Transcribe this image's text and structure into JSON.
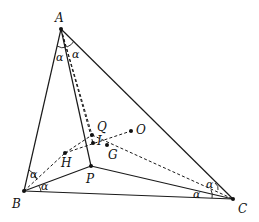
{
  "figure": {
    "type": "geometry-diagram",
    "points": {
      "A": {
        "label": "A",
        "x": 61,
        "y": 29
      },
      "B": {
        "label": "B",
        "x": 24,
        "y": 191
      },
      "C": {
        "label": "C",
        "x": 233,
        "y": 199
      },
      "P": {
        "label": "P",
        "x": 91,
        "y": 166
      },
      "Q": {
        "label": "Q",
        "x": 92,
        "y": 135
      },
      "I": {
        "label": "I",
        "x": 93,
        "y": 143
      },
      "G": {
        "label": "G",
        "x": 107,
        "y": 145
      },
      "O": {
        "label": "O",
        "x": 131,
        "y": 131
      },
      "H": {
        "label": "H",
        "x": 65,
        "y": 153
      }
    },
    "solid_segments": [
      [
        "A",
        "B"
      ],
      [
        "B",
        "C"
      ],
      [
        "C",
        "A"
      ],
      [
        "A",
        "P"
      ],
      [
        "B",
        "P"
      ],
      [
        "C",
        "P"
      ]
    ],
    "dashed_segments": [
      [
        "A",
        "I"
      ],
      [
        "A",
        "Q"
      ],
      [
        "H",
        "Q"
      ],
      [
        "H",
        "O"
      ],
      [
        "Q",
        "C"
      ]
    ],
    "angle_label": "α",
    "angle_marks": [
      {
        "vertex": "A",
        "label": "α"
      },
      {
        "vertex": "A",
        "label": "α"
      },
      {
        "vertex": "B",
        "label": "α"
      },
      {
        "vertex": "B",
        "label": "α"
      },
      {
        "vertex": "C",
        "label": "α"
      },
      {
        "vertex": "C",
        "label": "α"
      }
    ]
  }
}
